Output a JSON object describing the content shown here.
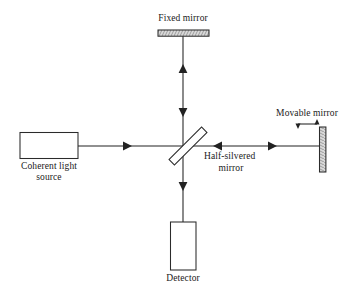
{
  "diagram": {
    "stroke_color": "#222222",
    "fill_color": "#ffffff",
    "hatch_color": "#9a9a9a",
    "background": "#ffffff",
    "components": {
      "fixed_mirror": {
        "label": "Fixed mirror",
        "shape": "horizontal-hatched-bar"
      },
      "coherent_light_source": {
        "label_line1": "Coherent light",
        "label_line2": "source",
        "shape": "rectangle"
      },
      "half_silvered_mirror": {
        "label_line1": "Half-silvered",
        "label_line2": "mirror",
        "shape": "diagonal-bar-45deg"
      },
      "movable_mirror": {
        "label": "Movable mirror",
        "shape": "vertical-bar",
        "motion_indicator": "double-headed-horizontal-arrow"
      },
      "detector": {
        "label": "Detector",
        "shape": "rectangle"
      }
    },
    "beams": [
      {
        "name": "source-to-splitter",
        "direction": "right"
      },
      {
        "name": "splitter-to-fixed-mirror",
        "direction": "up"
      },
      {
        "name": "fixed-mirror-to-splitter",
        "direction": "down"
      },
      {
        "name": "splitter-to-movable-mirror",
        "direction": "right"
      },
      {
        "name": "movable-mirror-to-splitter",
        "direction": "left"
      },
      {
        "name": "splitter-to-detector",
        "direction": "down"
      }
    ]
  }
}
